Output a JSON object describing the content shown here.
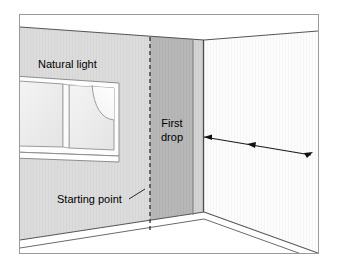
{
  "figure": {
    "type": "room-wallpaper-diagram",
    "labels": {
      "natural_light": "Natural light",
      "first_drop_line1": "First",
      "first_drop_line2": "drop",
      "starting_point": "Starting point"
    },
    "colors": {
      "left_wall": "#dcdcdc",
      "first_drop_strip": "#b4b4b4",
      "corner_strip": "#d2d2d2",
      "right_wall": "#fcfcfc",
      "ceiling": "#ffffff",
      "floor": "#ffffff",
      "window_pane": "#ededed",
      "window_highlight": "#f8f8f8",
      "outline": "#4d4d4d",
      "border": "#a0a0a0",
      "text": "#000000",
      "background": "#ffffff"
    },
    "elements": {
      "dashed_line_name": "starting-point-dashed-line",
      "arrow_name": "hanging-direction-arrow",
      "window_name": "window",
      "corner_name": "room-corner"
    }
  }
}
